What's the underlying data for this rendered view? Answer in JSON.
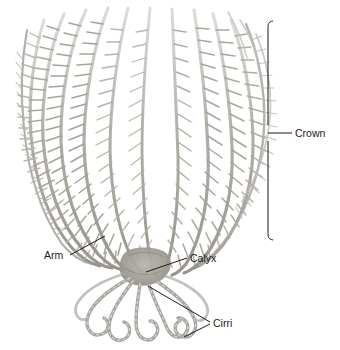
{
  "figure": {
    "background_color": "#ffffff",
    "ink_color": "#1b1b1b",
    "body_color": "#9a978f",
    "body_color_light": "#c8c6c0",
    "body_color_pale": "#e2e0db"
  },
  "labels": {
    "crown": "Crown",
    "arm": "Arm",
    "calyx": "Calyx",
    "cirri": "Cirri"
  },
  "annotations": {
    "crown_bracket": {
      "x": 268,
      "top": 21,
      "bottom": 240,
      "tick_y": 133,
      "tick_x_end": 292
    },
    "arm_leader": {
      "x1": 70,
      "y1": 255,
      "x2": 105,
      "y2": 236
    },
    "calyx_leader": {
      "x1": 146,
      "y1": 272,
      "x2": 187,
      "y2": 258
    },
    "cirri_leader_a": {
      "x1": 148,
      "y1": 286,
      "x2": 210,
      "y2": 322
    },
    "cirri_leader_b": {
      "x1": 184,
      "y1": 336,
      "x2": 210,
      "y2": 324
    }
  },
  "anatomy": {
    "arm_count": 13,
    "cirri_count": 7,
    "crown_top_y": 8,
    "crown_bottom_y": 260,
    "crown_left_x": 10,
    "crown_right_x": 256,
    "calyx_center": {
      "x": 143,
      "y": 265
    }
  }
}
